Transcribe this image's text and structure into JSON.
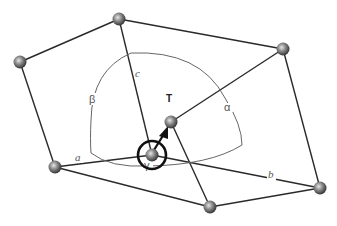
{
  "diagram": {
    "type": "unit-cell",
    "colors": {
      "edge": "#2a2a2a",
      "arc": "#666666",
      "atom_light": "#d8d8d8",
      "atom_dark": "#3a3a3a",
      "label": "#555555"
    },
    "axis_labels": {
      "a": "a",
      "b": "b",
      "c": "c"
    },
    "angle_labels": {
      "alpha": "α",
      "beta": "β",
      "gamma": "γ"
    },
    "vector_label": "T"
  }
}
